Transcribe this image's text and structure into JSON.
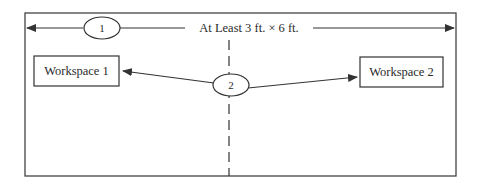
{
  "diagram": {
    "dimension_label": "At Least 3 ft. × 6 ft.",
    "callouts": [
      {
        "number": "1",
        "meaning": "overall dimension"
      },
      {
        "number": "2",
        "meaning": "separation between workspaces"
      }
    ],
    "workspaces": [
      {
        "label": "Workspace 1"
      },
      {
        "label": "Workspace 2"
      }
    ],
    "colors": {
      "stroke": "#333333",
      "background": "#ffffff"
    }
  }
}
